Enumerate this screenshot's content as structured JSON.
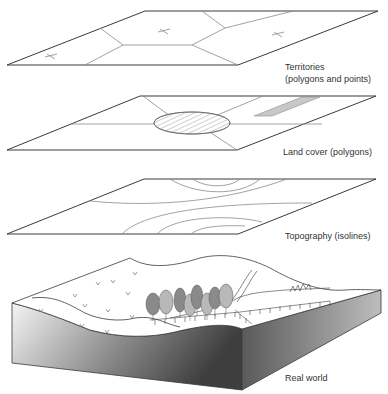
{
  "diagram": {
    "layers": [
      {
        "id": "territories",
        "label_lines": [
          "Territories",
          "(polygons and points)"
        ]
      },
      {
        "id": "land_cover",
        "label_lines": [
          "Land cover (polygons)"
        ]
      },
      {
        "id": "topography",
        "label_lines": [
          "Topography (isolines)"
        ]
      },
      {
        "id": "real_world",
        "label_lines": [
          "Real world"
        ]
      }
    ],
    "colors": {
      "outline": "#3a3a3a",
      "inner_line": "#8a8a8a",
      "strip_fill": "#c8c8c8",
      "tree_dark": "#8a8a8a",
      "tree_light": "#b8b8b8",
      "block_dark": "#4a4a4a",
      "block_light": "#f2f2f2"
    }
  }
}
